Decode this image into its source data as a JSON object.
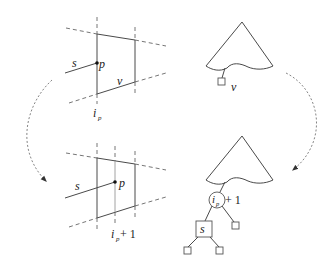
{
  "figure": {
    "top_left": {
      "labels": {
        "segment": "s",
        "point": "p",
        "slab_region": "v",
        "index": "i",
        "index_sub": "p"
      }
    },
    "bottom_left": {
      "labels": {
        "segment": "s",
        "point": "p",
        "index": "i",
        "index_sub": "p",
        "index_suffix": " + 1"
      }
    },
    "top_right": {
      "labels": {
        "leaf": "v"
      }
    },
    "bottom_right": {
      "labels": {
        "node_index": "i",
        "node_index_sub": "p",
        "node_suffix": "+ 1",
        "segment_node": "s"
      }
    },
    "colors": {
      "line": "#4a4a4a",
      "dashed": "#666666",
      "arrow": "#777777",
      "background": "#ffffff"
    }
  }
}
